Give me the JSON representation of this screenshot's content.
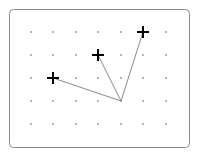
{
  "board": {
    "frame": {
      "x": 9.5,
      "y": 9.5,
      "width": 180,
      "height": 138,
      "radius": 4,
      "stroke": "#8c8c8c"
    },
    "grid": {
      "columns_x": [
        31,
        53,
        76,
        98,
        121,
        143,
        166
      ],
      "rows_y": [
        32,
        55,
        78,
        101,
        124
      ],
      "dot_color": "#333333"
    },
    "hub": {
      "x": 121,
      "y": 101
    },
    "line_color": "#8a8a8a",
    "cross_color": "#000000",
    "crosses": [
      {
        "x": 53,
        "y": 78
      },
      {
        "x": 98,
        "y": 55
      },
      {
        "x": 143,
        "y": 32
      }
    ]
  }
}
